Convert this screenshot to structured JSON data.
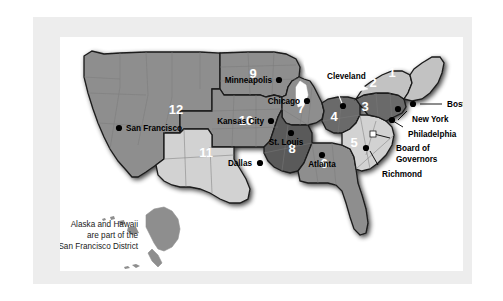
{
  "figure": {
    "kind": "map",
    "note_lines": [
      "Alaska and Hawaii",
      "are part of the",
      "San Francisco District"
    ]
  },
  "colors": {
    "page_background": "#ffffff",
    "panel_background": "#ededed",
    "plate_background": "#ffffff",
    "district_mid": "#8e8e8e",
    "district_light": "#c2c2c2",
    "district_lighter": "#d2d2d2",
    "district_dark": "#6a6a6a",
    "district_darker": "#5a5a5a",
    "outline": "#1a1a1a",
    "state_line": "#7a7a7a",
    "label_text": "#000000",
    "number_text": "#ffffff"
  },
  "districts": [
    {
      "number": "1",
      "bank": "Boston",
      "shade": "district_light"
    },
    {
      "number": "2",
      "bank": "New York",
      "shade": "district_light"
    },
    {
      "number": "3",
      "bank": "Philadelphia",
      "shade": "district_dark"
    },
    {
      "number": "4",
      "bank": "Cleveland",
      "shade": "district_dark"
    },
    {
      "number": "5",
      "bank": "Richmond",
      "shade": "district_lighter"
    },
    {
      "number": "6",
      "bank": "Atlanta",
      "shade": "district_mid"
    },
    {
      "number": "7",
      "bank": "Chicago",
      "shade": "district_mid"
    },
    {
      "number": "8",
      "bank": "St. Louis",
      "shade": "district_darker"
    },
    {
      "number": "9",
      "bank": "Minneapolis",
      "shade": "district_mid"
    },
    {
      "number": "10",
      "bank": "Kansas City",
      "shade": "district_mid"
    },
    {
      "number": "11",
      "bank": "Dallas",
      "shade": "district_lighter"
    },
    {
      "number": "12",
      "bank": "San Francisco",
      "shade": "district_mid"
    }
  ],
  "city_labels": [
    {
      "name": "Minneapolis",
      "text": "Minneapolis"
    },
    {
      "name": "Chicago",
      "text": "Chicago"
    },
    {
      "name": "Cleveland",
      "text": "Cleveland"
    },
    {
      "name": "Boston",
      "text": "Boston"
    },
    {
      "name": "New York",
      "text": "New York"
    },
    {
      "name": "Philadelphia",
      "text": "Philadelphia"
    },
    {
      "name": "Board",
      "text": "Board of"
    },
    {
      "name": "Governors",
      "text": "Governors"
    },
    {
      "name": "Richmond",
      "text": "Richmond"
    },
    {
      "name": "Atlanta",
      "text": "Atlanta"
    },
    {
      "name": "St. Louis",
      "text": "St. Louis"
    },
    {
      "name": "Kansas City",
      "text": "Kansas City"
    },
    {
      "name": "Dallas",
      "text": "Dallas"
    },
    {
      "name": "San Francisco",
      "text": "San Francisco"
    }
  ],
  "numbers": {
    "d1": "1",
    "d2": "2",
    "d3": "3",
    "d4": "4",
    "d5": "5",
    "d6": "6",
    "d7": "7",
    "d8": "8",
    "d9": "9",
    "d10": "10",
    "d11": "11",
    "d12": "12"
  },
  "labels": {
    "minneapolis": "Minneapolis",
    "chicago": "Chicago",
    "cleveland": "Cleveland",
    "boston": "Boston",
    "new_york": "New York",
    "philadelphia": "Philadelphia",
    "board_of": "Board of",
    "governors": "Governors",
    "richmond": "Richmond",
    "atlanta": "Atlanta",
    "st_louis": "St. Louis",
    "kansas_city": "Kansas City",
    "dallas": "Dallas",
    "san_francisco": "San Francisco",
    "note_1": "Alaska and Hawaii",
    "note_2": "are part of the",
    "note_3": "San Francisco District"
  }
}
